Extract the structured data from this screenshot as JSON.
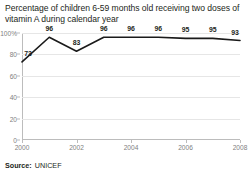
{
  "chart_data": {
    "type": "line",
    "title": "Percentage of children 6-59 months old receiving two doses of vitamin A during calendar year",
    "xlabel": "",
    "ylabel": "",
    "categories": [
      2000,
      2001,
      2002,
      2003,
      2004,
      2005,
      2006,
      2007,
      2008
    ],
    "values": [
      73,
      96,
      83,
      96,
      96,
      96,
      95,
      95,
      93
    ],
    "point_labels": [
      "73",
      "96",
      "83",
      "96",
      "96",
      "96",
      "95",
      "95",
      "93"
    ],
    "ylim": [
      0,
      100
    ],
    "xlim": [
      2000,
      2008
    ],
    "ytick_labels": [
      "100%",
      "80",
      "60",
      "40",
      "20",
      "0"
    ],
    "ytick_values": [
      100,
      80,
      60,
      40,
      20,
      0
    ],
    "xtick_labels": [
      "2000",
      "2002",
      "2004",
      "2006",
      "2008"
    ],
    "xtick_values": [
      2000,
      2002,
      2004,
      2006,
      2008
    ],
    "grid": "horizontal",
    "legend": "none",
    "series_color": "#1a1a1a",
    "grid_color": "#e6e6e6",
    "axis_color": "#bcbcbc",
    "tick_label_color": "#808080"
  },
  "source": {
    "label": "Source:",
    "value": "UNICEF"
  }
}
